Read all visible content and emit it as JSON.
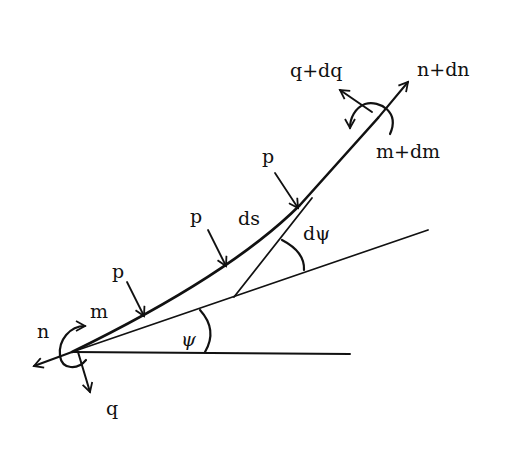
{
  "diagram": {
    "labels": {
      "q_plus_dq": "q+dq",
      "n_plus_dn": "n+dn",
      "m_plus_dm": "m+dm",
      "p1": "p",
      "p2": "p",
      "p3": "p",
      "ds": "ds",
      "dpsi": "dψ",
      "psi": "ψ",
      "n": "n",
      "m": "m",
      "q": "q"
    },
    "colors": {
      "ink": "#111111",
      "background": "#ffffff"
    }
  }
}
